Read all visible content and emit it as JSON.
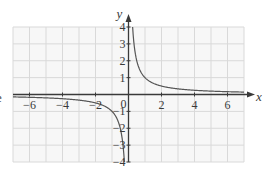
{
  "chart_data": {
    "type": "line",
    "title": "",
    "function": "y = 1/x",
    "xlabel": "x",
    "ylabel": "y",
    "xlim": [
      -7,
      7
    ],
    "ylim": [
      -4,
      4
    ],
    "grid": true,
    "x_ticks": [
      -6,
      -4,
      -2,
      0,
      2,
      4,
      6
    ],
    "x_tick_labels": [
      "−6",
      "−4",
      "−2",
      "0",
      "2",
      "4",
      "6"
    ],
    "y_ticks": [
      -4,
      -3,
      -2,
      -1,
      1,
      2,
      3,
      4
    ],
    "y_tick_labels": [
      "−4",
      "−3",
      "−2",
      "−1",
      "1",
      "2",
      "3",
      "4"
    ],
    "origin_label": "0",
    "series": [
      {
        "name": "y = 1/x (x > 0)",
        "x": [
          0.25,
          0.3,
          0.4,
          0.5,
          0.75,
          1,
          1.5,
          2,
          3,
          4,
          5,
          6,
          7
        ],
        "values": [
          4,
          3.33,
          2.5,
          2,
          1.33,
          1,
          0.67,
          0.5,
          0.33,
          0.25,
          0.2,
          0.17,
          0.14
        ]
      },
      {
        "name": "y = 1/x (x < 0)",
        "x": [
          -7,
          -6,
          -5,
          -4,
          -3,
          -2,
          -1.5,
          -1,
          -0.75,
          -0.5,
          -0.4,
          -0.3,
          -0.25
        ],
        "values": [
          -0.14,
          -0.17,
          -0.2,
          -0.25,
          -0.33,
          -0.5,
          -0.67,
          -1,
          -1.33,
          -2,
          -2.5,
          -3.33,
          -4
        ]
      }
    ],
    "colors": {
      "grid": "#d9d9d9",
      "grid_fill": "#f7f7f7",
      "axis": "#3a3a3a",
      "curve": "#555555"
    }
  },
  "page": {
    "clipped_fragment": "e"
  }
}
